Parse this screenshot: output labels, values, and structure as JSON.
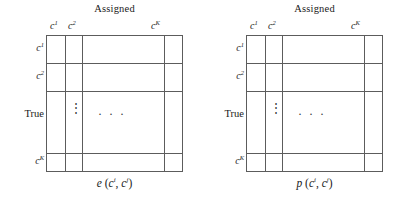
{
  "figure": {
    "panels": [
      {
        "id": "panel-left",
        "title": "Assigned",
        "row_axis_label": "True",
        "column_headers": [
          {
            "base": "c",
            "sup": "1"
          },
          {
            "base": "c",
            "sup": "2"
          },
          {
            "base": "c",
            "sup": "K"
          }
        ],
        "row_headers": [
          {
            "base": "c",
            "sup": "1"
          },
          {
            "base": "c",
            "sup": "2"
          },
          {
            "base": "c",
            "sup": "K"
          }
        ],
        "vertical_ellipsis": "⋮",
        "horizontal_ellipsis": "· · ·",
        "caption": {
          "function": "e",
          "open": " (",
          "arg1_base": "c",
          "arg1_sup": "i",
          "separator": ", ",
          "arg2_base": "c",
          "arg2_sup": "j",
          "close": ")"
        }
      },
      {
        "id": "panel-right",
        "title": "Assigned",
        "row_axis_label": "True",
        "column_headers": [
          {
            "base": "c",
            "sup": "1"
          },
          {
            "base": "c",
            "sup": "2"
          },
          {
            "base": "c",
            "sup": "K"
          }
        ],
        "row_headers": [
          {
            "base": "c",
            "sup": "1"
          },
          {
            "base": "c",
            "sup": "2"
          },
          {
            "base": "c",
            "sup": "K"
          }
        ],
        "vertical_ellipsis": "⋮",
        "horizontal_ellipsis": "· · ·",
        "caption": {
          "function": "p",
          "open": " (",
          "arg1_base": "c",
          "arg1_sup": "i",
          "separator": ", ",
          "arg2_base": "c",
          "arg2_sup": "j",
          "close": ")"
        }
      }
    ],
    "colors": {
      "line": "#5c5c5c",
      "text": "#1a1a1a",
      "background": "#ffffff"
    }
  }
}
